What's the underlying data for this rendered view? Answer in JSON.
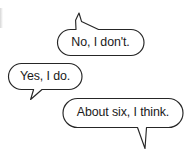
{
  "canvas": {
    "width": 190,
    "height": 157,
    "background": "#ffffff",
    "stroke_color": "#262626",
    "text_color": "#1a1a1a"
  },
  "bubbles": [
    {
      "id": "bubble-no-i-dont",
      "text": "No, I don't.",
      "tail_direction": "up-left",
      "order": 1
    },
    {
      "id": "bubble-yes-i-do",
      "text": "Yes, I do.",
      "tail_direction": "down-left",
      "order": 2
    },
    {
      "id": "bubble-about-six",
      "text": "About six, I think.",
      "tail_direction": "down-right",
      "order": 3
    }
  ]
}
